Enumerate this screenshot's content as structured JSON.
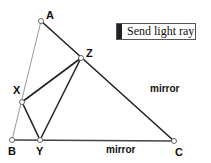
{
  "diagram": {
    "points": {
      "A": {
        "label": "A",
        "x": 41,
        "y": 21
      },
      "Z": {
        "label": "Z",
        "x": 81,
        "y": 58
      },
      "X": {
        "label": "X",
        "x": 22,
        "y": 102
      },
      "B": {
        "label": "B",
        "x": 12,
        "y": 140
      },
      "Y": {
        "label": "Y",
        "x": 40,
        "y": 140
      },
      "C": {
        "label": "C",
        "x": 174,
        "y": 141
      }
    },
    "mirrors": [
      {
        "label": "mirror",
        "side": "AC"
      },
      {
        "label": "mirror",
        "side": "BC"
      }
    ],
    "light_path": [
      "X",
      "Z",
      "Y",
      "X"
    ],
    "colors": {
      "line": "#222222",
      "thin_line": "#888888",
      "point_fill": "#ffffff"
    }
  },
  "button": {
    "label": "Send light ray"
  }
}
